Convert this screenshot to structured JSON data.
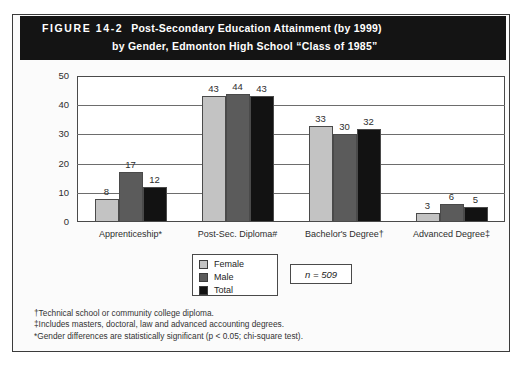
{
  "figure": {
    "number": "FIGURE 14-2",
    "title_line_1": "Post-Secondary Education Attainment (by 1999)",
    "title_line_2": "by Gender, Edmonton High School “Class of 1985”"
  },
  "sample_note": "n = 509",
  "colors": {
    "female": "#c3c3c3",
    "male": "#5b5b5b",
    "total": "#121212",
    "banner": "#141414",
    "frame": "#4a4a4a"
  },
  "notes": [
    "†Technical school or community college diploma.",
    "‡Includes masters, doctoral, law and advanced accounting degrees.",
    "*Gender differences are statistically significant (p < 0.05; chi-square test)."
  ],
  "chart_data": {
    "type": "bar",
    "title": "Post-Secondary Education Attainment (by 1999) by Gender, Edmonton High School “Class of 1985”",
    "xlabel": "",
    "ylabel": "",
    "ylim": [
      0,
      50
    ],
    "yticks": [
      0,
      10,
      20,
      30,
      40,
      50
    ],
    "grid": true,
    "legend_position": "bottom-center",
    "categories": [
      "Apprenticeship*",
      "Post-Sec. Diploma#",
      "Bachelor's Degree†",
      "Advanced Degree‡"
    ],
    "series": [
      {
        "name": "Female",
        "values": [
          8,
          43,
          33,
          3
        ]
      },
      {
        "name": "Male",
        "values": [
          17,
          44,
          30,
          6
        ]
      },
      {
        "name": "Total",
        "values": [
          12,
          43,
          32,
          5
        ]
      }
    ]
  }
}
